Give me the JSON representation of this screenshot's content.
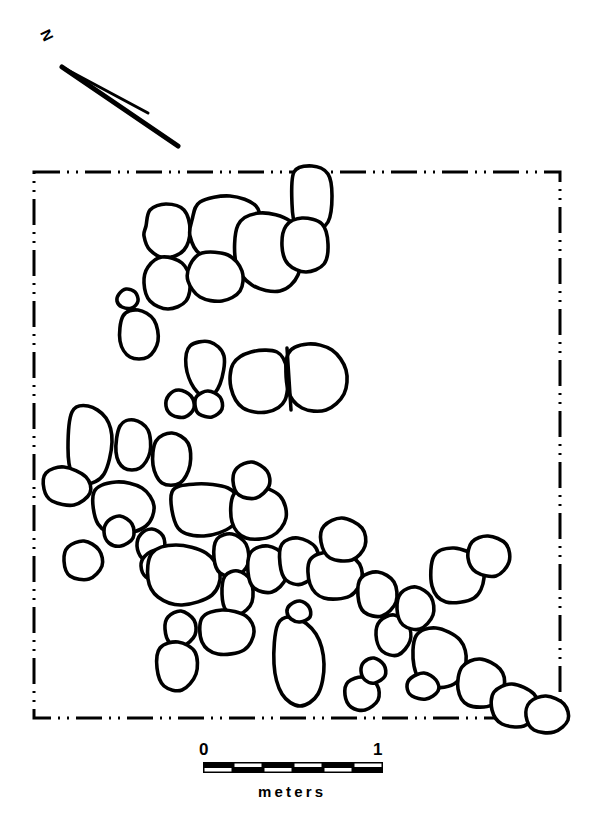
{
  "figure": {
    "kind": "archaeological-site-plan",
    "ink_color": "#000000",
    "background_color": "#ffffff"
  },
  "north_arrow": {
    "label": "N",
    "icon": "north-arrow-icon"
  },
  "plan_boundary": {
    "style": "dash-dot-dot",
    "x": 34,
    "y": 172,
    "width": 526,
    "height": 546,
    "stroke_width": 3
  },
  "scale_bar": {
    "start_label": "0",
    "end_label": "1",
    "units_label": "meters",
    "x": 203,
    "y": 762,
    "width": 180,
    "height": 11,
    "segments": 6,
    "fill": "#000000"
  },
  "stones": [
    {
      "id": "s01",
      "cx": 168,
      "cy": 232,
      "points": "-22,-6 -18,-22 -2,-28 16,-22 22,-2 16,18 -2,26 -18,18 -24,4"
    },
    {
      "id": "s02",
      "cx": 222,
      "cy": 230,
      "points": "-30,-10 -22,-28 8,-34 34,-24 38,-2 30,24 4,32 -22,24 -32,6"
    },
    {
      "id": "s03",
      "cx": 268,
      "cy": 253,
      "points": "-30,-28 -8,-40 22,-32 32,-8 30,22 12,38 -16,32 -32,10"
    },
    {
      "id": "s04",
      "cx": 168,
      "cy": 281,
      "points": "-20,-14 -6,-24 14,-18 22,0 18,20 0,28 -18,20 -24,2"
    },
    {
      "id": "s05",
      "cx": 216,
      "cy": 277,
      "points": "-26,-12 -14,-24 12,-22 26,-6 24,14 6,24 -16,20 -28,4"
    },
    {
      "id": "s06",
      "cx": 312,
      "cy": 200,
      "points": "-18,-28 0,-34 16,-26 20,-4 16,22 0,32 -16,26 -20,4"
    },
    {
      "id": "s07",
      "cx": 306,
      "cy": 244,
      "points": "-20,-18 -4,-26 16,-20 22,0 18,20 0,28 -18,20 -24,2"
    },
    {
      "id": "s08",
      "cx": 128,
      "cy": 299,
      "points": "-9,-5 -2,-10 7,-7 10,2 4,9 -6,8 -11,2"
    },
    {
      "id": "s09",
      "cx": 140,
      "cy": 335,
      "points": "-17,-19 -2,-25 14,-15 18,6 8,22 -10,22 -20,6"
    },
    {
      "id": "s10",
      "cx": 206,
      "cy": 370,
      "points": "-16,-24 4,-28 18,-14 14,14 2,28 -12,18 -20,-4"
    },
    {
      "id": "s11",
      "cx": 181,
      "cy": 404,
      "points": "-12,-9 -2,-14 10,-8 13,4 4,13 -9,11 -15,2"
    },
    {
      "id": "s12",
      "cx": 209,
      "cy": 404,
      "points": "-12,-8 -1,-13 11,-7 13,5 3,13 -10,10 -14,1"
    },
    {
      "id": "s13",
      "cx": 265,
      "cy": 382,
      "points": "-32,-18 -14,-30 12,-30 22,-12 20,18 2,30 -22,26 -34,6"
    },
    {
      "id": "s14",
      "cx": 314,
      "cy": 378,
      "points": "-26,-24 -6,-34 18,-28 32,-8 30,16 12,32 -12,30 -26,12"
    },
    {
      "id": "s15",
      "cx": 92,
      "cy": 446,
      "points": "-20,-34 -4,-40 14,-28 20,-4 12,28 -6,38 -20,28 -24,2"
    },
    {
      "id": "s16",
      "cx": 134,
      "cy": 446,
      "points": "-14,-20 0,-26 14,-16 16,6 6,22 -10,22 -18,6"
    },
    {
      "id": "s17",
      "cx": 172,
      "cy": 459,
      "points": "-16,-18 0,-26 16,-16 18,6 8,24 -10,24 -19,6"
    },
    {
      "id": "s18",
      "cx": 68,
      "cy": 487,
      "points": "-22,-14 -4,-20 18,-10 22,6 6,18 -16,14 -24,2"
    },
    {
      "id": "s19",
      "cx": 124,
      "cy": 508,
      "points": "-30,-16 -8,-26 18,-20 30,-2 22,18 -4,26 -26,16"
    },
    {
      "id": "s20",
      "cx": 206,
      "cy": 510,
      "points": "-34,-18 -10,-26 22,-22 34,-6 26,16 -2,26 -28,18"
    },
    {
      "id": "s21",
      "cx": 260,
      "cy": 514,
      "points": "-26,-20 -4,-28 20,-18 26,4 12,22 -14,24 -28,8"
    },
    {
      "id": "s22",
      "cx": 152,
      "cy": 546,
      "points": "-11,-12 0,-17 11,-10 12,4 2,14 -10,12 -15,0"
    },
    {
      "id": "s23",
      "cx": 157,
      "cy": 566,
      "points": "-12,-10 0,-16 12,-8 13,6 2,14 -11,11 -16,0"
    },
    {
      "id": "s24",
      "cx": 186,
      "cy": 575,
      "points": "-34,-22 -10,-30 20,-22 34,-2 26,20 -4,30 -28,22 -38,4"
    },
    {
      "id": "s25",
      "cx": 232,
      "cy": 556,
      "points": "-15,-17 0,-22 14,-12 16,8 4,20 -12,17 -18,2"
    },
    {
      "id": "s26",
      "cx": 238,
      "cy": 594,
      "points": "-13,-18 0,-23 13,-13 14,8 2,20 -12,16 -16,0"
    },
    {
      "id": "s27",
      "cx": 268,
      "cy": 570,
      "points": "-17,-18 0,-24 16,-14 18,8 4,22 -14,18 -20,2"
    },
    {
      "id": "s28",
      "cx": 300,
      "cy": 562,
      "points": "-18,-18 -2,-24 16,-14 18,8 2,22 -14,18 -20,2"
    },
    {
      "id": "s29",
      "cx": 336,
      "cy": 576,
      "points": "-26,-16 -6,-24 20,-16 26,2 14,20 -12,22 -26,8"
    },
    {
      "id": "s30",
      "cx": 378,
      "cy": 594,
      "points": "-17,-16 0,-22 16,-12 18,8 4,22 -14,18 -20,2"
    },
    {
      "id": "s31",
      "cx": 228,
      "cy": 632,
      "points": "-26,-14 -6,-22 18,-16 26,0 16,18 -10,22 -26,10"
    },
    {
      "id": "s32",
      "cx": 181,
      "cy": 629,
      "points": "-13,-12 0,-18 13,-9 14,6 2,17 -11,14 -16,0"
    },
    {
      "id": "s33",
      "cx": 178,
      "cy": 666,
      "points": "-18,-18 0,-24 17,-14 18,8 4,24 -14,20 -21,2"
    },
    {
      "id": "s34",
      "cx": 300,
      "cy": 662,
      "points": "-22,-38 -4,-44 16,-28 24,2 18,32 0,44 -18,32 -26,2"
    },
    {
      "id": "s35",
      "cx": 363,
      "cy": 694,
      "points": "-15,-12 0,-17 14,-9 15,6 2,16 -12,13 -18,1"
    },
    {
      "id": "s36",
      "cx": 374,
      "cy": 671,
      "points": "-10,-9 0,-13 10,-6 11,5 1,12 -9,9 -13,0"
    },
    {
      "id": "s37",
      "cx": 394,
      "cy": 635,
      "points": "-14,-14 0,-20 14,-10 16,6 4,20 -12,16 -18,0"
    },
    {
      "id": "s38",
      "cx": 416,
      "cy": 608,
      "points": "-15,-15 0,-21 15,-11 17,7 4,21 -13,17 -19,1"
    },
    {
      "id": "s39",
      "cx": 440,
      "cy": 658,
      "points": "-24,-22 -4,-30 20,-18 26,4 14,26 -14,28 -26,8"
    },
    {
      "id": "s40",
      "cx": 482,
      "cy": 683,
      "points": "-20,-16 -2,-24 18,-14 22,4 10,22 -14,22 -24,6"
    },
    {
      "id": "s41",
      "cx": 516,
      "cy": 706,
      "points": "-22,-14 -4,-22 18,-12 22,6 8,20 -14,18 -24,4"
    },
    {
      "id": "s42",
      "cx": 548,
      "cy": 714,
      "points": "-18,-12 -2,-18 16,-10 20,6 6,18 -14,16 -22,2"
    },
    {
      "id": "s43",
      "cx": 458,
      "cy": 576,
      "points": "-24,-20 -4,-28 20,-18 26,2 16,22 -12,26 -26,10"
    },
    {
      "id": "s44",
      "cx": 490,
      "cy": 556,
      "points": "-18,-14 -2,-20 16,-12 19,6 6,20 -14,16 -22,2"
    },
    {
      "id": "s45",
      "cx": 300,
      "cy": 612,
      "points": "-10,-7 0,-11 9,-5 10,5 0,10 -9,7 -13,0"
    },
    {
      "id": "s46",
      "cx": 424,
      "cy": 686,
      "points": "-13,-8 0,-13 12,-6 14,5 2,13 -12,10 -17,1"
    },
    {
      "id": "s47",
      "cx": 120,
      "cy": 532,
      "points": "-12,-11 0,-16 12,-8 13,6 1,14 -11,11 -16,0"
    },
    {
      "id": "s48",
      "cx": 344,
      "cy": 540,
      "points": "-20,-14 -2,-22 18,-12 21,6 8,20 -14,18 -23,2"
    },
    {
      "id": "s49",
      "cx": 252,
      "cy": 480,
      "points": "-15,-12 0,-18 15,-9 17,6 4,18 -13,15 -19,1"
    },
    {
      "id": "s50",
      "cx": 84,
      "cy": 560,
      "points": "-16,-13 0,-19 15,-10 18,6 5,19 -14,16 -20,1"
    }
  ]
}
